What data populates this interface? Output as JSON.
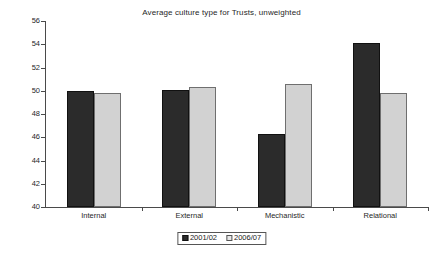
{
  "chart_data": {
    "type": "bar",
    "title": "Average culture type for Trusts, unweighted",
    "xlabel": "",
    "ylabel": "Per cent",
    "ylim": [
      40,
      56
    ],
    "ytick_step": 2,
    "yticks": [
      "56",
      "54",
      "52",
      "50",
      "48",
      "46",
      "44",
      "42",
      "40"
    ],
    "grid": false,
    "legend_position": "bottom-center",
    "categories": [
      "Internal",
      "External",
      "Mechanistic",
      "Relational"
    ],
    "series": [
      {
        "name": "2001/02",
        "color": "#2b2b2b",
        "values": [
          50.0,
          50.1,
          46.3,
          54.1
        ]
      },
      {
        "name": "2006/07",
        "color": "#d2d2d2",
        "values": [
          49.8,
          50.3,
          50.6,
          49.8
        ]
      }
    ]
  },
  "legend": {
    "items": [
      {
        "label": "2001/02",
        "swatch": "dark-square-swatch"
      },
      {
        "label": "2006/07",
        "swatch": "light-square-swatch"
      }
    ]
  }
}
